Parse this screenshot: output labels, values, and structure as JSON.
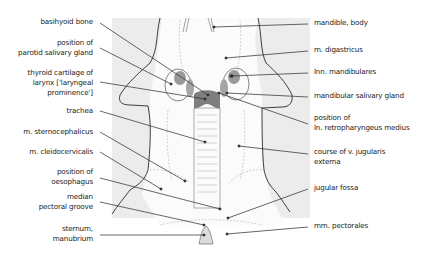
{
  "diagram": {
    "colors": {
      "background_region": "#ebebeb",
      "outline": "#2a2a2a",
      "leader_line": "#333333",
      "gland_fill": "#9a9a9a",
      "larynx_fill": "#7a7a7a",
      "faint_line": "#b5b5b5"
    },
    "labels_left": [
      {
        "id": "basihyoid",
        "lines": [
          "basihyoid bone"
        ]
      },
      {
        "id": "parotid",
        "lines": [
          "position of",
          "parotid salivary gland"
        ]
      },
      {
        "id": "thyroid",
        "lines": [
          "thyroid cartilage of",
          "larynx ['laryngeal",
          "prominence']"
        ]
      },
      {
        "id": "trachea",
        "lines": [
          "trachea"
        ]
      },
      {
        "id": "sternocephalicus",
        "lines": [
          "m. sternocephalicus"
        ]
      },
      {
        "id": "cleidocervicalis",
        "lines": [
          "m. cleidocervicalis"
        ]
      },
      {
        "id": "oesophagus",
        "lines": [
          "position of",
          "oesophagus"
        ]
      },
      {
        "id": "pectoral_groove",
        "lines": [
          "median",
          "pectoral groove"
        ]
      },
      {
        "id": "sternum",
        "lines": [
          "sternum,",
          "manubrium"
        ]
      }
    ],
    "labels_right": [
      {
        "id": "mandible",
        "lines": [
          "mandible, body"
        ]
      },
      {
        "id": "digastricus",
        "lines": [
          "m. digastricus"
        ]
      },
      {
        "id": "lnn_mandibulares",
        "lines": [
          "lnn. mandibulares"
        ]
      },
      {
        "id": "mandibular_gland",
        "lines": [
          "mandibular salivary gland"
        ]
      },
      {
        "id": "retropharyngeus",
        "lines": [
          "position of",
          "ln. retropharyngeus medius"
        ]
      },
      {
        "id": "jugularis",
        "lines": [
          "course of v. jugularis",
          "externa"
        ]
      },
      {
        "id": "jugular_fossa",
        "lines": [
          "jugular fossa"
        ]
      },
      {
        "id": "pectorales",
        "lines": [
          "mm. pectorales"
        ]
      }
    ]
  }
}
